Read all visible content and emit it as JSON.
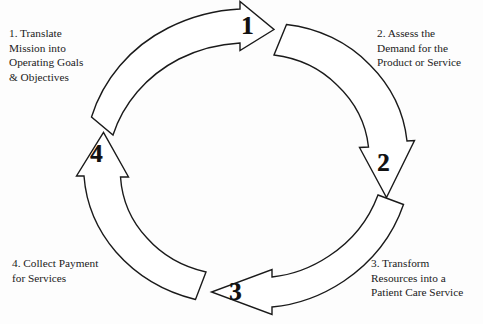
{
  "diagram": {
    "type": "cyclical-process",
    "background_color": "#fdfdfd",
    "stroke_color": "#1a1a1a",
    "fill_color": "#ffffff",
    "direction": "clockwise",
    "steps": [
      {
        "number": "1",
        "arrow_name": "arrow-step-1",
        "position": "top",
        "arrowhead_direction": "right",
        "caption_lines": [
          "1.  Translate",
          "Mission into",
          "Operating Goals",
          "& Objectives"
        ]
      },
      {
        "number": "2",
        "arrow_name": "arrow-step-2",
        "position": "right",
        "arrowhead_direction": "down",
        "caption_lines": [
          "2.  Assess the",
          "Demand for the",
          "Product or Service"
        ]
      },
      {
        "number": "3",
        "arrow_name": "arrow-step-3",
        "position": "bottom",
        "arrowhead_direction": "left",
        "caption_lines": [
          "3.  Transform",
          "Resources into a",
          "Patient Care Service"
        ]
      },
      {
        "number": "4",
        "arrow_name": "arrow-step-4",
        "position": "left",
        "arrowhead_direction": "up",
        "caption_lines": [
          "4.  Collect Payment",
          "for Services"
        ]
      }
    ]
  }
}
